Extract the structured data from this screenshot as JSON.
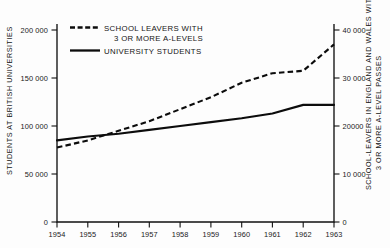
{
  "chart_data": {
    "type": "line",
    "title": "",
    "xlabel": "",
    "categories": [
      "1954",
      "1955",
      "1956",
      "1957",
      "1958",
      "1959",
      "1960",
      "1961",
      "1962",
      "1963"
    ],
    "x": [
      1954,
      1955,
      1956,
      1957,
      1958,
      1959,
      1960,
      1961,
      1962,
      1963
    ],
    "xlim": [
      1954,
      1963
    ],
    "grid": false,
    "legend_position": "top-left-inside",
    "series": [
      {
        "name": "SCHOOL LEAVERS WITH 3 OR MORE A-LEVELS",
        "style": "dashed",
        "axis": "right",
        "values": [
          15500,
          17000,
          19000,
          21000,
          23500,
          26000,
          29000,
          31000,
          31500,
          37000
        ]
      },
      {
        "name": "UNIVERSITY STUDENTS",
        "style": "solid",
        "axis": "left",
        "values": [
          85000,
          89000,
          92000,
          96000,
          100000,
          104000,
          108000,
          113000,
          122000,
          122000
        ]
      }
    ],
    "left_axis": {
      "label": "STUDENTS AT BRITISH UNIVERSITIES",
      "ylim": [
        0,
        210000
      ],
      "ticks": [
        0,
        50000,
        100000,
        150000,
        200000
      ],
      "tick_labels": [
        "0",
        "50 000",
        "100 000",
        "150 000",
        "200 000"
      ]
    },
    "right_axis": {
      "label": "SCHOOL-LEAVERS IN ENGLAND AND WALES WITH 3 OR MORE A-LEVEL PASSES",
      "ylim": [
        0,
        42000
      ],
      "ticks": [
        0,
        10000,
        20000,
        30000,
        40000
      ],
      "tick_labels": [
        "0",
        "10 000",
        "20000",
        "30 000",
        "40 000"
      ]
    }
  },
  "legend": {
    "entries": [
      {
        "line1": "SCHOOL LEAVERS WITH",
        "line2": "3 OR MORE A-LEVELS",
        "swatch": "dashed-line-swatch"
      },
      {
        "line1": "UNIVERSITY STUDENTS",
        "line2": "",
        "swatch": "solid-line-swatch"
      }
    ]
  },
  "colors": {
    "ink": "#0c0c0c",
    "background": "#fdfdfd"
  }
}
